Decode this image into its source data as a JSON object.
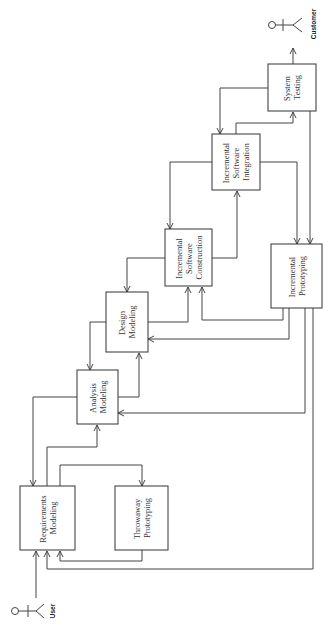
{
  "diagram": {
    "orientation": "rotated-90-ccw",
    "actors": {
      "user": {
        "label": "User"
      },
      "customer": {
        "label": "Customer"
      }
    },
    "boxes": {
      "requirements": {
        "line1": "Requirements",
        "line2": "Modeling"
      },
      "throwaway": {
        "line1": "Throwaway",
        "line2": "Prototyping"
      },
      "analysis": {
        "line1": "Analysis",
        "line2": "Modeling"
      },
      "design": {
        "line1": "Design",
        "line2": "Modeling"
      },
      "construction": {
        "line1": "Incremental",
        "line2": "Software",
        "line3": "Construction"
      },
      "integration": {
        "line1": "Incremental",
        "line2": "Software",
        "line3": "Integration"
      },
      "testing": {
        "line1": "System",
        "line2": "Testing"
      },
      "prototyping": {
        "line1": "Incremental",
        "line2": "Prototyping"
      }
    },
    "colors": {
      "stroke": "#444444",
      "background": "#ffffff",
      "text": "#333333"
    }
  }
}
